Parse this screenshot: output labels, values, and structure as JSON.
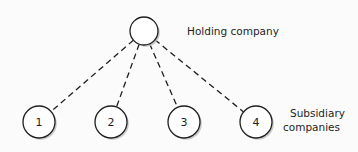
{
  "diagram": {
    "type": "hierarchy",
    "parent": {
      "id": "holding",
      "label": "Holding company",
      "x": 144,
      "y": 31,
      "r": 14
    },
    "children_label": [
      "Subsidiary",
      "companies"
    ],
    "children": [
      {
        "id": "1",
        "label": "1",
        "x": 39,
        "y": 122,
        "r": 16
      },
      {
        "id": "2",
        "label": "2",
        "x": 111,
        "y": 122,
        "r": 16
      },
      {
        "id": "3",
        "label": "3",
        "x": 184,
        "y": 122,
        "r": 16
      },
      {
        "id": "4",
        "label": "4",
        "x": 256,
        "y": 122,
        "r": 16
      }
    ],
    "edge_style": "dashed",
    "colors": {
      "stroke": "#1e1e1e",
      "shadow": "#bdbdbd",
      "fill": "#ffffff"
    }
  }
}
